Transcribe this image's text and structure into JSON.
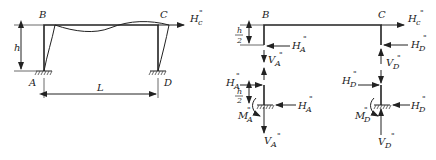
{
  "left_frame": {
    "labels": {
      "B": "B",
      "C": "C",
      "A": "A",
      "D": "D",
      "h": "h",
      "L": "L",
      "H_C": "H",
      "H_C_sub": "c",
      "H_C_sup": "\""
    }
  },
  "right_frame": {
    "labels": {
      "B": "B",
      "C": "C",
      "h_over_2_top_num": "h",
      "h_over_2_top_den": "2",
      "h_over_2_bot_num": "h",
      "h_over_2_bot_den": "2",
      "H_C": "H",
      "H_C_sub": "c",
      "H_A": "H",
      "A_sub": "A",
      "H_D": "H",
      "D_sub": "D",
      "V_A": "V",
      "V_D": "V",
      "M_A": "M",
      "M_D": "M",
      "prime": "\""
    }
  }
}
